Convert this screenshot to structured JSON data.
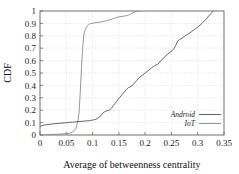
{
  "chart_data": {
    "type": "line",
    "title": "",
    "xlabel": "Average of betweenness centrality",
    "ylabel": "CDF",
    "xlim": [
      0,
      0.35
    ],
    "ylim": [
      0,
      1
    ],
    "grid": true,
    "legend_position": "bottom-right",
    "xticks": [
      "0",
      "0.05",
      "0.1",
      "0.15",
      "0.2",
      "0.25",
      "0.3",
      "0.35"
    ],
    "xtick_values": [
      0,
      0.05,
      0.1,
      0.15,
      0.2,
      0.25,
      0.3,
      0.35
    ],
    "yticks": [
      "0",
      "0.1",
      "0.2",
      "0.3",
      "0.4",
      "0.5",
      "0.6",
      "0.7",
      "0.8",
      "0.9",
      "1"
    ],
    "ytick_values": [
      0,
      0.1,
      0.2,
      0.3,
      0.4,
      0.5,
      0.6,
      0.7,
      0.8,
      0.9,
      1
    ],
    "series": [
      {
        "name": "Android",
        "color": "#555555",
        "x": [
          0.0,
          0.004,
          0.008,
          0.012,
          0.018,
          0.024,
          0.03,
          0.038,
          0.046,
          0.054,
          0.062,
          0.07,
          0.078,
          0.086,
          0.094,
          0.1,
          0.106,
          0.11,
          0.114,
          0.118,
          0.12,
          0.124,
          0.128,
          0.132,
          0.136,
          0.14,
          0.144,
          0.148,
          0.152,
          0.156,
          0.16,
          0.164,
          0.168,
          0.172,
          0.176,
          0.18,
          0.184,
          0.188,
          0.194,
          0.2,
          0.206,
          0.212,
          0.218,
          0.224,
          0.23,
          0.236,
          0.242,
          0.248,
          0.254,
          0.258,
          0.262,
          0.266,
          0.27,
          0.276,
          0.284,
          0.292,
          0.3,
          0.308,
          0.316,
          0.324,
          0.33
        ],
        "y": [
          0.07,
          0.075,
          0.08,
          0.083,
          0.086,
          0.089,
          0.092,
          0.095,
          0.098,
          0.101,
          0.104,
          0.107,
          0.11,
          0.113,
          0.116,
          0.12,
          0.126,
          0.136,
          0.15,
          0.166,
          0.18,
          0.19,
          0.196,
          0.2,
          0.215,
          0.24,
          0.262,
          0.285,
          0.305,
          0.325,
          0.345,
          0.365,
          0.382,
          0.39,
          0.4,
          0.42,
          0.44,
          0.46,
          0.48,
          0.5,
          0.52,
          0.54,
          0.56,
          0.57,
          0.6,
          0.625,
          0.648,
          0.67,
          0.69,
          0.72,
          0.76,
          0.77,
          0.78,
          0.8,
          0.82,
          0.845,
          0.87,
          0.9,
          0.935,
          0.975,
          1.0
        ]
      },
      {
        "name": "IoT",
        "color": "#8a8a8a",
        "x": [
          0.0,
          0.01,
          0.02,
          0.03,
          0.04,
          0.05,
          0.056,
          0.06,
          0.064,
          0.068,
          0.07,
          0.072,
          0.074,
          0.075,
          0.076,
          0.077,
          0.078,
          0.079,
          0.08,
          0.081,
          0.082,
          0.083,
          0.084,
          0.086,
          0.088,
          0.09,
          0.092,
          0.094,
          0.096,
          0.1,
          0.104,
          0.11,
          0.116,
          0.122,
          0.13,
          0.14,
          0.15,
          0.158,
          0.164,
          0.17,
          0.176,
          0.182,
          0.19
        ],
        "y": [
          0.0,
          0.002,
          0.004,
          0.006,
          0.008,
          0.01,
          0.014,
          0.02,
          0.03,
          0.05,
          0.075,
          0.11,
          0.17,
          0.23,
          0.3,
          0.38,
          0.46,
          0.54,
          0.62,
          0.69,
          0.745,
          0.79,
          0.82,
          0.85,
          0.868,
          0.88,
          0.888,
          0.894,
          0.898,
          0.902,
          0.905,
          0.908,
          0.912,
          0.918,
          0.925,
          0.94,
          0.952,
          0.958,
          0.962,
          0.97,
          0.985,
          0.996,
          1.0
        ]
      }
    ]
  },
  "legend": {
    "items": [
      {
        "label": "Android"
      },
      {
        "label": "IoT"
      }
    ]
  },
  "axes": {
    "x_title": "Average of betweenness centrality",
    "y_title": "CDF"
  },
  "colors": {
    "android_line": "#555555",
    "iot_line": "#8a8a8a",
    "grid": "#c8c8c8",
    "frame": "#666666",
    "background": "#ffffff"
  }
}
